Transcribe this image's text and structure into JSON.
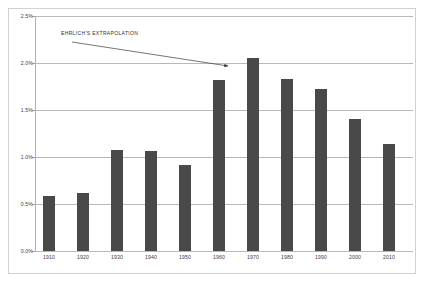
{
  "chart_data": {
    "type": "bar",
    "title": "",
    "subtitle": "",
    "xlabel": "",
    "ylabel": "",
    "categories": [
      "1910",
      "1920",
      "1930",
      "1940",
      "1950",
      "1960",
      "1970",
      "1980",
      "1990",
      "2000",
      "2010"
    ],
    "values": [
      0.59,
      0.62,
      1.08,
      1.06,
      0.92,
      1.82,
      2.05,
      1.83,
      1.72,
      1.4,
      1.14
    ],
    "value_format": "percent",
    "ylim": [
      0.0,
      2.5
    ],
    "ytick_labels": [
      "0.0%",
      "0.5%",
      "1.0%",
      "1.5%",
      "2.0%",
      "2.5%"
    ],
    "ytick_values": [
      0.0,
      0.5,
      1.0,
      1.5,
      2.0,
      2.5
    ],
    "grid": true,
    "grid_axis": "y",
    "legend": false,
    "legend_position": "none",
    "bar_color": "#494949",
    "gridline_color": "#b8b8b8",
    "frame_color": "#d2d2d2",
    "annotations": [
      {
        "text": "EHRLICH'S EXTRAPOLATION",
        "arrow_from_category": "1910",
        "arrow_to_category": "1960",
        "arrow_to_value": 2.0
      }
    ]
  },
  "annotation": {
    "label": "EHRLICH'S EXTRAPOLATION"
  }
}
